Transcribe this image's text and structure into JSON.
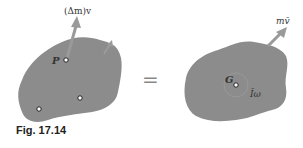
{
  "figure": {
    "caption": "Fig. 17.14",
    "left_body": {
      "point_label": "P",
      "momentum_label": "(Δm)v"
    },
    "equals_sign": "=",
    "right_body": {
      "center_label": "G",
      "linear_momentum_label": "mv̄",
      "angular_momentum_label": "Īω"
    },
    "colors": {
      "body_fill": "#8c8c8c",
      "arrow": "#9a9a9a",
      "background": "#ffffff"
    }
  }
}
